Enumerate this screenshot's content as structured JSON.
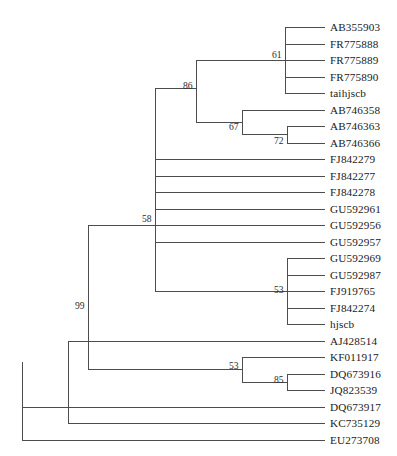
{
  "figure": {
    "type": "phylogenetic-tree",
    "title": "",
    "width": 397,
    "height": 456,
    "background_color": "#ffffff",
    "branch_color": "#4d4d4d",
    "label_color": "#1a1a1a"
  },
  "tips": [
    {
      "label": "AB355903",
      "y": 27,
      "branch_x": 285,
      "label_x": 330
    },
    {
      "label": "FR775888",
      "y": 44,
      "branch_x": 285,
      "label_x": 330
    },
    {
      "label": "FR775889",
      "y": 60,
      "branch_x": 285,
      "label_x": 330
    },
    {
      "label": "FR775890",
      "y": 77,
      "branch_x": 285,
      "label_x": 330
    },
    {
      "label": "taihjscb",
      "y": 93,
      "branch_x": 285,
      "label_x": 330
    },
    {
      "label": "AB746358",
      "y": 110,
      "branch_x": 242,
      "label_x": 330
    },
    {
      "label": "AB746363",
      "y": 126,
      "branch_x": 287,
      "label_x": 330
    },
    {
      "label": "AB746366",
      "y": 143,
      "branch_x": 287,
      "label_x": 330
    },
    {
      "label": "FJ842279",
      "y": 159,
      "branch_x": 155,
      "label_x": 330
    },
    {
      "label": "FJ842277",
      "y": 176,
      "branch_x": 155,
      "label_x": 330
    },
    {
      "label": "FJ842278",
      "y": 192,
      "branch_x": 155,
      "label_x": 330
    },
    {
      "label": "GU592961",
      "y": 209,
      "branch_x": 155,
      "label_x": 330
    },
    {
      "label": "GU592956",
      "y": 225,
      "branch_x": 155,
      "label_x": 330
    },
    {
      "label": "GU592957",
      "y": 242,
      "branch_x": 155,
      "label_x": 330
    },
    {
      "label": "GU592969",
      "y": 258,
      "branch_x": 287,
      "label_x": 330
    },
    {
      "label": "GU592987",
      "y": 275,
      "branch_x": 287,
      "label_x": 330
    },
    {
      "label": "FJ919765",
      "y": 291,
      "branch_x": 287,
      "label_x": 330
    },
    {
      "label": "FJ842274",
      "y": 308,
      "branch_x": 287,
      "label_x": 330
    },
    {
      "label": "hjscb",
      "y": 324,
      "branch_x": 287,
      "label_x": 330
    },
    {
      "label": "AJ428514",
      "y": 341,
      "branch_x": 88,
      "label_x": 330
    },
    {
      "label": "KF011917",
      "y": 357,
      "branch_x": 242,
      "label_x": 330
    },
    {
      "label": "DQ673916",
      "y": 374,
      "branch_x": 287,
      "label_x": 330
    },
    {
      "label": "JQ823539",
      "y": 390,
      "branch_x": 287,
      "label_x": 330
    },
    {
      "label": "DQ673917",
      "y": 407,
      "branch_x": 68,
      "label_x": 330
    },
    {
      "label": "KC735129",
      "y": 423,
      "branch_x": 68,
      "label_x": 330
    },
    {
      "label": "EU273708",
      "y": 440,
      "branch_x": 22,
      "label_x": 330
    }
  ],
  "support_values": [
    {
      "value": "61",
      "x": 272,
      "y": 55,
      "node": "node-clade-fr-group"
    },
    {
      "value": "86",
      "x": 183,
      "y": 86,
      "node": "node-clade-upper"
    },
    {
      "value": "67",
      "x": 229,
      "y": 127,
      "node": "node-clade-ab746"
    },
    {
      "value": "72",
      "x": 274,
      "y": 141,
      "node": "node-clade-ab746363-366"
    },
    {
      "value": "58",
      "x": 142,
      "y": 219,
      "node": "node-clade-main"
    },
    {
      "value": "53",
      "x": 274,
      "y": 290,
      "node": "node-clade-gu-fj"
    },
    {
      "value": "99",
      "x": 75,
      "y": 306,
      "node": "node-clade-deep"
    },
    {
      "value": "53",
      "x": 229,
      "y": 366,
      "node": "node-clade-kf-dq"
    },
    {
      "value": "85",
      "x": 274,
      "y": 380,
      "node": "node-clade-dq673916-jq823539"
    }
  ],
  "internal_nodes": [
    {
      "name": "node-clade-fr-group",
      "x": 285,
      "y_top": 27,
      "y_bottom": 93,
      "parent_x": 196,
      "y": 60
    },
    {
      "name": "node-clade-ab746363-366",
      "x": 287,
      "y_top": 126,
      "y_bottom": 143,
      "parent_x": 242,
      "y": 134
    },
    {
      "name": "node-clade-ab746",
      "x": 242,
      "y_top": 110,
      "y_bottom": 134,
      "parent_x": 196,
      "y": 122
    },
    {
      "name": "node-clade-upper",
      "x": 196,
      "y_top": 60,
      "y_bottom": 122,
      "parent_x": 155,
      "y": 88
    },
    {
      "name": "node-clade-gu-fj",
      "x": 287,
      "y_top": 258,
      "y_bottom": 324,
      "parent_x": 155,
      "y": 291
    },
    {
      "name": "node-clade-main",
      "x": 155,
      "y_top": 88,
      "y_bottom": 291,
      "parent_x": 88,
      "y": 225
    },
    {
      "name": "node-clade-dq673916-jq823539",
      "x": 287,
      "y_top": 374,
      "y_bottom": 390,
      "parent_x": 242,
      "y": 382
    },
    {
      "name": "node-clade-kf-dq",
      "x": 242,
      "y_top": 357,
      "y_bottom": 382,
      "parent_x": 88,
      "y": 369
    },
    {
      "name": "node-clade-deep",
      "x": 88,
      "y_top": 225,
      "y_bottom": 369,
      "parent_x": 68,
      "y": 341
    },
    {
      "name": "node-clade-outer",
      "x": 68,
      "y_top": 341,
      "y_bottom": 423,
      "parent_x": 22,
      "y": 407
    },
    {
      "name": "node-root",
      "x": 22,
      "y_top": 362,
      "y_bottom": 440,
      "parent_x": 22,
      "y": 440
    }
  ]
}
